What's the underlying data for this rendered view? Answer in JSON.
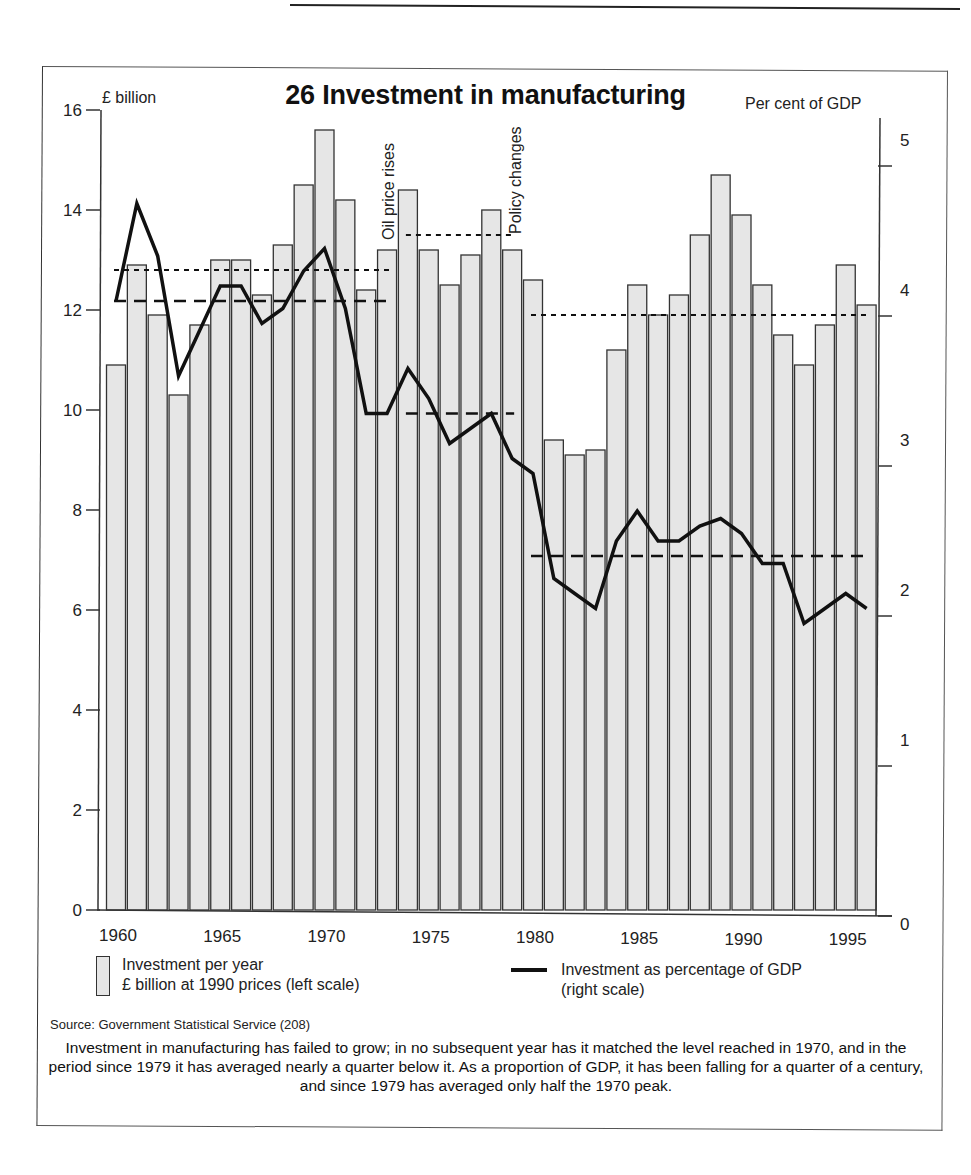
{
  "figure": {
    "title": "26 Investment in manufacturing",
    "left_axis_unit": "£ billion",
    "right_axis_unit": "Per cent of GDP",
    "annotations": [
      "Oil price rises",
      "Policy changes"
    ],
    "legend": {
      "bars_line1": "Investment per year",
      "bars_line2": "£ billion at 1990 prices (left scale)",
      "line_line1": "Investment as percentage of GDP",
      "line_line2": "(right scale)"
    },
    "source": "Source: Government Statistical Service (208)",
    "caption": "Investment in manufacturing has failed to grow; in no subsequent year has it matched the level reached in 1970, and in the period since 1979 it has averaged nearly a quarter below it. As a proportion of GDP, it has been falling for a quarter of a century, and since 1979 has averaged only half the 1970 peak."
  },
  "colors": {
    "bar_fill": "#e6e6e6",
    "bar_stroke": "#333333",
    "line": "#111111"
  },
  "chart_data": {
    "type": "bar",
    "title": "26 Investment in manufacturing",
    "xlabel": "",
    "ylabel": "£ billion",
    "y2label": "Per cent of GDP",
    "ylim": [
      0,
      16
    ],
    "y2lim": [
      0,
      5.3
    ],
    "left_ticks": [
      0,
      2,
      4,
      6,
      8,
      10,
      12,
      14,
      16
    ],
    "right_ticks": [
      0,
      1,
      2,
      3,
      4,
      5
    ],
    "x_tick_labels": [
      "1960",
      "1965",
      "1970",
      "1975",
      "1980",
      "1985",
      "1990",
      "1995"
    ],
    "grid": false,
    "legend_position": "bottom",
    "categories": [
      1960,
      1961,
      1962,
      1963,
      1964,
      1965,
      1966,
      1967,
      1968,
      1969,
      1970,
      1971,
      1972,
      1973,
      1974,
      1975,
      1976,
      1977,
      1978,
      1979,
      1980,
      1981,
      1982,
      1983,
      1984,
      1985,
      1986,
      1987,
      1988,
      1989,
      1990,
      1991,
      1992,
      1993,
      1994,
      1995,
      1996
    ],
    "series": [
      {
        "name": "Investment per year £ billion at 1990 prices (left scale)",
        "type": "bar",
        "axis": "left",
        "values": [
          10.9,
          12.9,
          11.9,
          10.3,
          11.7,
          13.0,
          13.0,
          12.3,
          13.3,
          14.5,
          15.6,
          14.2,
          12.4,
          13.2,
          14.4,
          13.2,
          12.5,
          13.1,
          14.0,
          13.2,
          12.6,
          9.4,
          9.1,
          9.2,
          11.2,
          12.5,
          11.9,
          12.3,
          13.5,
          14.7,
          13.9,
          12.5,
          11.5,
          10.9,
          11.7,
          12.9,
          12.1
        ]
      },
      {
        "name": "Investment as percentage of GDP (right scale)",
        "type": "line",
        "axis": "right",
        "values": [
          4.1,
          4.75,
          4.4,
          3.6,
          3.9,
          4.2,
          4.2,
          3.95,
          4.05,
          4.3,
          4.45,
          4.05,
          3.35,
          3.35,
          3.65,
          3.45,
          3.15,
          3.25,
          3.35,
          3.05,
          2.95,
          2.25,
          2.15,
          2.05,
          2.5,
          2.7,
          2.5,
          2.5,
          2.6,
          2.65,
          2.55,
          2.35,
          2.35,
          1.95,
          2.05,
          2.15,
          2.05
        ]
      }
    ],
    "period_averages": [
      {
        "series": "bars",
        "style": "dotted",
        "from": 1960,
        "to": 1973,
        "value": 12.8
      },
      {
        "series": "bars",
        "style": "dotted",
        "from": 1974,
        "to": 1979,
        "value": 13.5
      },
      {
        "series": "bars",
        "style": "dotted",
        "from": 1980,
        "to": 1996,
        "value": 11.9
      },
      {
        "series": "line",
        "style": "dashed",
        "from": 1960,
        "to": 1973,
        "value": 4.1
      },
      {
        "series": "line",
        "style": "dashed",
        "from": 1974,
        "to": 1979,
        "value": 3.35
      },
      {
        "series": "line",
        "style": "dashed",
        "from": 1980,
        "to": 1996,
        "value": 2.4
      }
    ],
    "annotations": [
      {
        "text": "Oil price rises",
        "x": 1973.5,
        "orientation": "vertical"
      },
      {
        "text": "Policy changes",
        "x": 1979.5,
        "orientation": "vertical"
      }
    ]
  }
}
